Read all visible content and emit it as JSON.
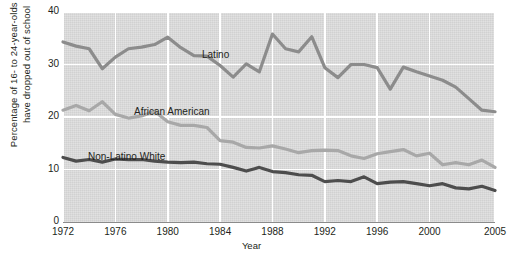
{
  "chart_data": {
    "type": "line",
    "title": "",
    "xlabel": "Year",
    "ylabel": "Percentage of 16- to 24-year-olds who have dropped out of school",
    "ylabel_line1": "Percentage of 16- to 24-year-olds who",
    "ylabel_line2": "have dropped out of school",
    "xlim": [
      1972,
      2005
    ],
    "ylim": [
      0,
      40
    ],
    "yticks": [
      "0",
      "10",
      "20",
      "30",
      "40"
    ],
    "ytick_values": [
      0,
      10,
      20,
      30,
      40
    ],
    "xticks": [
      "1972",
      "1976",
      "1980",
      "1984",
      "1988",
      "1992",
      "1996",
      "2000",
      "2005"
    ],
    "xtick_values": [
      1972,
      1976,
      1980,
      1984,
      1988,
      1992,
      1996,
      2000,
      2005
    ],
    "grid": true,
    "legend_position": "inline-labels",
    "plot_background": "#d9d9d9",
    "x": [
      1972,
      1973,
      1974,
      1975,
      1976,
      1977,
      1978,
      1979,
      1980,
      1981,
      1982,
      1983,
      1984,
      1985,
      1986,
      1987,
      1988,
      1989,
      1990,
      1991,
      1992,
      1993,
      1994,
      1995,
      1996,
      1997,
      1998,
      1999,
      2000,
      2001,
      2002,
      2003,
      2004,
      2005
    ],
    "series": [
      {
        "name": "Latino",
        "color": "#8c8c8c",
        "label_x": 202,
        "label_y": 49,
        "values": [
          34.3,
          33.5,
          33.0,
          29.2,
          31.4,
          33.0,
          33.3,
          33.8,
          35.2,
          33.2,
          31.7,
          31.6,
          29.8,
          27.6,
          30.1,
          28.6,
          35.8,
          33.0,
          32.4,
          35.3,
          29.4,
          27.5,
          30.0,
          30.0,
          29.4,
          25.3,
          29.5,
          28.6,
          27.8,
          27.0,
          25.7,
          23.5,
          21.3,
          21.0
        ]
      },
      {
        "name": "African American",
        "color": "#a8a8a8",
        "label_x": 134,
        "label_y": 106,
        "values": [
          21.3,
          22.2,
          21.2,
          22.9,
          20.5,
          19.8,
          20.2,
          21.1,
          19.1,
          18.4,
          18.4,
          18.0,
          15.5,
          15.2,
          14.2,
          14.1,
          14.5,
          13.9,
          13.2,
          13.6,
          13.7,
          13.6,
          12.6,
          12.1,
          13.0,
          13.4,
          13.8,
          12.6,
          13.1,
          10.9,
          11.3,
          10.9,
          11.8,
          10.4
        ]
      },
      {
        "name": "Non-Latino White",
        "color": "#4d4d4d",
        "label_x": 88,
        "label_y": 151,
        "values": [
          12.3,
          11.6,
          11.9,
          11.4,
          12.0,
          11.9,
          11.9,
          11.6,
          11.4,
          11.3,
          11.4,
          11.1,
          11.0,
          10.4,
          9.7,
          10.4,
          9.6,
          9.4,
          9.0,
          8.9,
          7.7,
          7.9,
          7.7,
          8.6,
          7.3,
          7.6,
          7.7,
          7.3,
          6.9,
          7.3,
          6.5,
          6.3,
          6.8,
          6.0
        ]
      }
    ]
  }
}
